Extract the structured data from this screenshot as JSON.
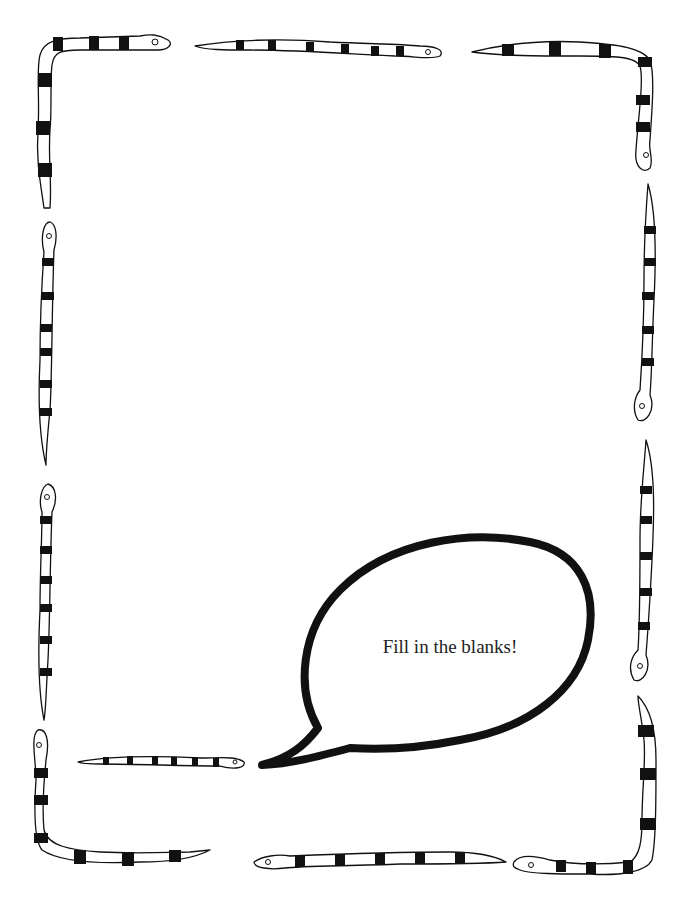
{
  "bubble": {
    "text": "Fill in the blanks!"
  },
  "border": {
    "decoration": "snake-border",
    "snake_count": 12
  },
  "colors": {
    "ink": "#111111",
    "background": "#ffffff"
  }
}
